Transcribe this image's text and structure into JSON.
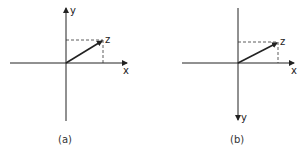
{
  "panels": [
    {
      "id": "a",
      "caption": "(a)",
      "labels": {
        "x": "x",
        "y": "y",
        "z": "z"
      },
      "y_axis_direction": "up"
    },
    {
      "id": "b",
      "caption": "(b)",
      "labels": {
        "x": "x",
        "y": "y",
        "z": "z"
      },
      "y_axis_direction": "down"
    }
  ],
  "colors": {
    "line": "#222222",
    "background": "#ffffff"
  }
}
